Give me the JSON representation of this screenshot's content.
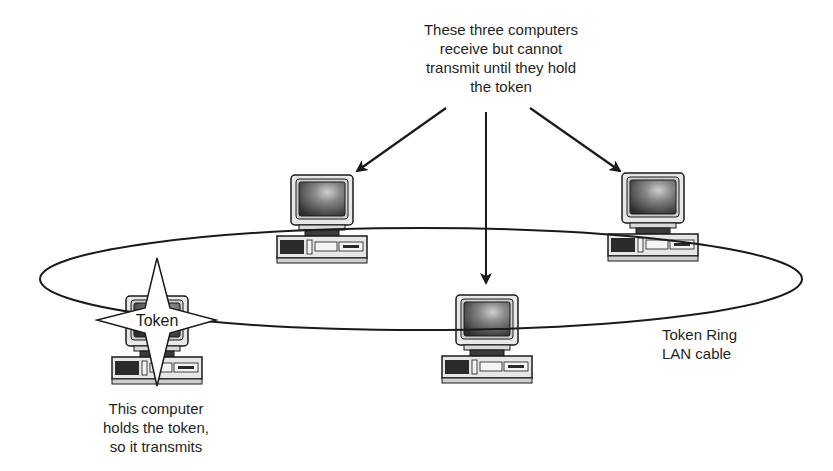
{
  "diagram": {
    "notes": {
      "receivers": [
        "These three computers",
        "receive but cannot",
        "transmit until they hold",
        "the token"
      ],
      "holder": [
        "This computer",
        "holds the token,",
        "so it transmits"
      ],
      "cable": [
        "Token Ring",
        "LAN cable"
      ]
    },
    "token_label": "Token",
    "nodes": [
      {
        "id": "holder",
        "role": "transmits (holds token)",
        "has_token": true
      },
      {
        "id": "top-left",
        "role": "receives only",
        "has_token": false
      },
      {
        "id": "bottom-center",
        "role": "receives only",
        "has_token": false
      },
      {
        "id": "top-right",
        "role": "receives only",
        "has_token": false
      }
    ],
    "edges": [
      {
        "from": "receivers-note",
        "to": "top-left",
        "type": "arrow"
      },
      {
        "from": "receivers-note",
        "to": "bottom-center",
        "type": "arrow"
      },
      {
        "from": "receivers-note",
        "to": "top-right",
        "type": "arrow"
      },
      {
        "from": "ring",
        "connects": [
          "holder",
          "top-left",
          "top-right",
          "bottom-center"
        ],
        "type": "ring-cable"
      }
    ],
    "colors": {
      "ink": "#1a1a1a",
      "screen_dark": "#2e2e2e",
      "screen_light": "#bdbdbd",
      "case": "#e6e6e6",
      "background": "#ffffff"
    }
  }
}
